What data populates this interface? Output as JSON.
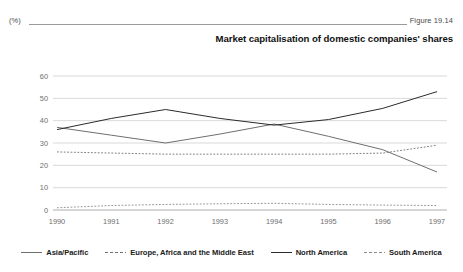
{
  "header": {
    "unit_label": "(%)",
    "figure_number": "Figure 19.14",
    "title": "Market capitalisation of domestic companies' shares"
  },
  "legend": {
    "items": [
      {
        "label": "Asia/Pacific",
        "style": "solid",
        "color": "#6f6f6f"
      },
      {
        "label": "Europe, Africa and the Middle East",
        "style": "dashed",
        "color": "#707070"
      },
      {
        "label": "North America",
        "style": "solid",
        "color": "#2b2b2b"
      },
      {
        "label": "South America",
        "style": "dashed",
        "color": "#8a8a8a"
      }
    ]
  },
  "chart_data": {
    "type": "line",
    "title": "Market capitalisation of domestic companies' shares",
    "xlabel": "",
    "ylabel": "(%)",
    "ylim": [
      0,
      60
    ],
    "yticks": [
      0,
      10,
      20,
      30,
      40,
      50,
      60
    ],
    "grid": true,
    "legend_position": "bottom",
    "categories": [
      "1990",
      "1991",
      "1992",
      "1993",
      "1994",
      "1995",
      "1996",
      "1997"
    ],
    "series": [
      {
        "name": "Asia/Pacific",
        "style": "solid",
        "color": "#6f6f6f",
        "values": [
          37.0,
          33.5,
          30.0,
          34.0,
          38.5,
          33.0,
          27.0,
          17.0
        ]
      },
      {
        "name": "Europe, Africa and the Middle East",
        "style": "dashed",
        "color": "#707070",
        "values": [
          26.0,
          25.5,
          25.0,
          25.0,
          25.0,
          25.0,
          25.5,
          29.0
        ]
      },
      {
        "name": "North America",
        "style": "solid",
        "color": "#2b2b2b",
        "values": [
          36.0,
          41.0,
          45.0,
          41.0,
          38.0,
          40.5,
          45.5,
          53.0
        ]
      },
      {
        "name": "South America",
        "style": "dashed",
        "color": "#8a8a8a",
        "values": [
          1.0,
          2.0,
          2.5,
          2.8,
          3.0,
          2.5,
          2.2,
          2.0
        ]
      }
    ]
  }
}
